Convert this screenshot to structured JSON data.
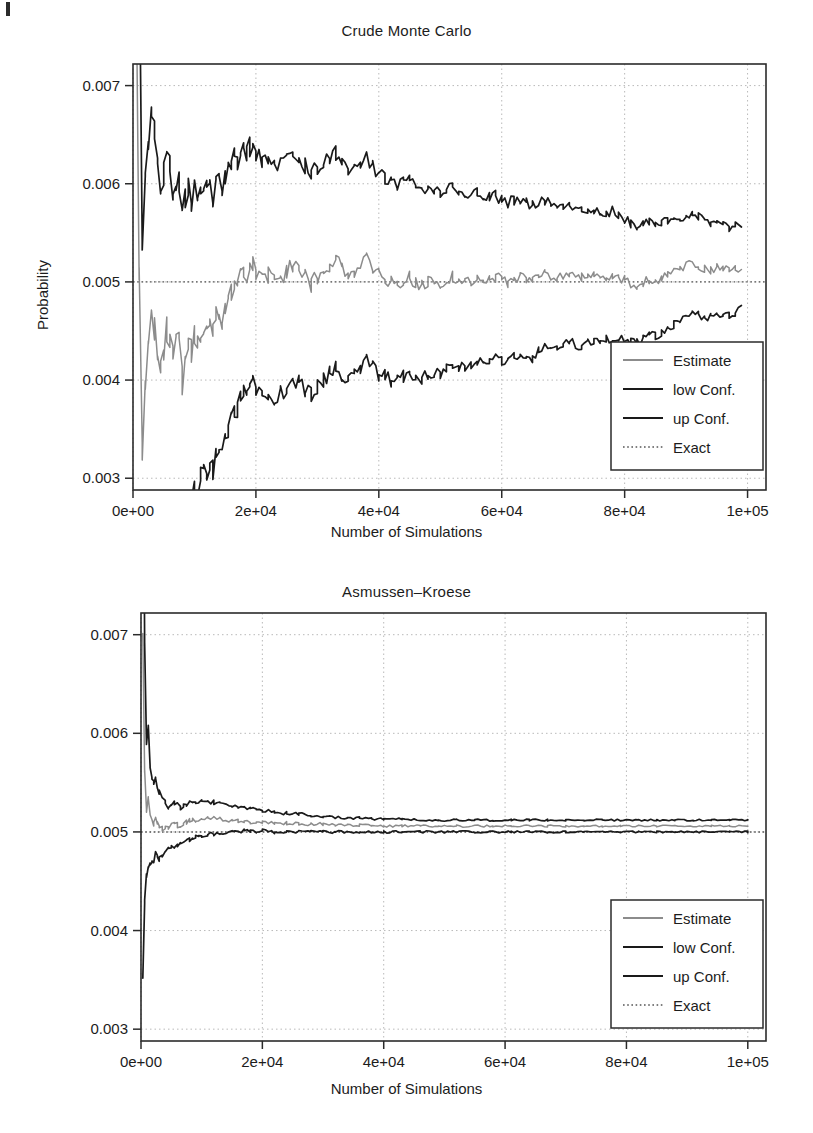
{
  "figure": {
    "scan_artifact": "page-edge-mark",
    "axis_label_x": "Number of Simulations",
    "axis_label_y": "Probability"
  },
  "colors": {
    "estimate": "#8c8c8c",
    "low_conf": "#1a1a1a",
    "up_conf": "#1a1a1a",
    "exact": "#555555",
    "frame": "#2b2b2b",
    "grid": "#b9b9b9",
    "background": "#ffffff"
  },
  "legend": {
    "entries": [
      {
        "label": "Estimate",
        "style": "solid",
        "color_key": "estimate"
      },
      {
        "label": "low Conf.",
        "style": "solid",
        "color_key": "low_conf"
      },
      {
        "label": "up Conf.",
        "style": "solid",
        "color_key": "up_conf"
      },
      {
        "label": "Exact",
        "style": "dotted",
        "color_key": "exact"
      }
    ],
    "position": "bottom-right"
  },
  "chart_data": [
    {
      "id": "crude-monte-carlo",
      "type": "line",
      "title": "Crude Monte Carlo",
      "xlabel": "Number of Simulations",
      "ylabel": "Probability",
      "xlim": [
        0,
        103000
      ],
      "ylim": [
        0.00288,
        0.00722
      ],
      "xticks": [
        0,
        20000,
        40000,
        60000,
        80000,
        100000
      ],
      "xticklabels": [
        "0e+00",
        "2e+04",
        "4e+04",
        "6e+04",
        "8e+04",
        "1e+05"
      ],
      "yticks": [
        0.003,
        0.004,
        0.005,
        0.006,
        0.007
      ],
      "yticklabels": [
        "0.003",
        "0.004",
        "0.005",
        "0.006",
        "0.007"
      ],
      "grid": true,
      "legend": "bottom-right",
      "exact_value": 0.005,
      "x": [
        500,
        1000,
        1500,
        2000,
        2500,
        3000,
        3500,
        4000,
        4500,
        5000,
        5500,
        6000,
        6500,
        7000,
        7500,
        8000,
        8500,
        9000,
        9500,
        10000,
        10500,
        11000,
        11500,
        12000,
        12500,
        13000,
        13500,
        14000,
        14500,
        15000,
        15500,
        16000,
        16500,
        17000,
        17500,
        18000,
        18500,
        19000,
        19500,
        20000,
        21000,
        22000,
        23000,
        24000,
        25000,
        26000,
        27000,
        28000,
        29000,
        30000,
        31000,
        32000,
        33000,
        34000,
        35000,
        36000,
        37000,
        38000,
        39000,
        40000,
        41000,
        42000,
        43000,
        44000,
        45000,
        46000,
        47000,
        48000,
        49000,
        50000,
        51000,
        52000,
        53000,
        54000,
        55000,
        56000,
        57000,
        58000,
        59000,
        60000,
        61000,
        62000,
        63000,
        64000,
        65000,
        66000,
        67000,
        68000,
        69000,
        70000,
        71000,
        72000,
        73000,
        74000,
        75000,
        76000,
        77000,
        78000,
        79000,
        80000,
        81000,
        82000,
        83000,
        84000,
        85000,
        86000,
        87000,
        88000,
        89000,
        90000,
        91000,
        92000,
        93000,
        94000,
        95000,
        96000,
        97000,
        98000,
        99000,
        100000
      ],
      "series": [
        {
          "name": "Estimate",
          "color_key": "estimate",
          "values": [
            0.0082,
            0.005,
            0.0033,
            0.00395,
            0.0044,
            0.00468,
            0.00452,
            0.0043,
            0.00418,
            0.0043,
            0.0045,
            0.00443,
            0.00428,
            0.00432,
            0.0044,
            0.004,
            0.00428,
            0.00438,
            0.0043,
            0.00442,
            0.00436,
            0.00444,
            0.00452,
            0.00448,
            0.00455,
            0.00448,
            0.00465,
            0.0047,
            0.00462,
            0.00476,
            0.00485,
            0.00492,
            0.005,
            0.00496,
            0.00508,
            0.00515,
            0.00505,
            0.00512,
            0.0052,
            0.0051,
            0.00502,
            0.00508,
            0.00498,
            0.00505,
            0.0051,
            0.00516,
            0.00512,
            0.00505,
            0.00498,
            0.00505,
            0.00512,
            0.00516,
            0.00522,
            0.00514,
            0.00508,
            0.00512,
            0.00518,
            0.00524,
            0.00516,
            0.00508,
            0.00505,
            0.005,
            0.00498,
            0.00502,
            0.00505,
            0.005,
            0.00497,
            0.005,
            0.00502,
            0.00499,
            0.00502,
            0.00506,
            0.00503,
            0.005,
            0.00502,
            0.00504,
            0.00501,
            0.00503,
            0.00505,
            0.00502,
            0.005,
            0.00503,
            0.00506,
            0.00503,
            0.005,
            0.00504,
            0.00507,
            0.00505,
            0.00503,
            0.00506,
            0.00509,
            0.00506,
            0.00504,
            0.00507,
            0.00505,
            0.00503,
            0.00506,
            0.00508,
            0.00505,
            0.00502,
            0.00499,
            0.00497,
            0.005,
            0.00503,
            0.00501,
            0.00504,
            0.00507,
            0.0051,
            0.00513,
            0.00516,
            0.00519,
            0.00517,
            0.00514,
            0.00512,
            0.00514,
            0.00513,
            0.00511,
            0.00513,
            0.00515
          ]
        },
        {
          "name": "low Conf.",
          "color_key": "low_conf",
          "values": [
            0.002,
            0.0015,
            0.0012,
            0.0018,
            0.0023,
            0.00265,
            0.00255,
            0.00242,
            0.00236,
            0.00252,
            0.00272,
            0.00268,
            0.00258,
            0.00265,
            0.00275,
            0.0024,
            0.00272,
            0.00283,
            0.00278,
            0.00292,
            0.00288,
            0.00298,
            0.00308,
            0.00305,
            0.00314,
            0.00308,
            0.00326,
            0.00333,
            0.00326,
            0.00342,
            0.00352,
            0.0036,
            0.0037,
            0.00367,
            0.0038,
            0.00388,
            0.00379,
            0.00387,
            0.00396,
            0.00387,
            0.00381,
            0.00388,
            0.00379,
            0.00387,
            0.00393,
            0.004,
            0.00397,
            0.00391,
            0.00385,
            0.00393,
            0.00401,
            0.00406,
            0.00413,
            0.00406,
            0.00401,
            0.00406,
            0.00413,
            0.0042,
            0.00413,
            0.00406,
            0.00404,
            0.004,
            0.00399,
            0.00404,
            0.00408,
            0.00404,
            0.00402,
            0.00406,
            0.00409,
            0.00407,
            0.00411,
            0.00416,
            0.00414,
            0.00412,
            0.00415,
            0.00418,
            0.00416,
            0.00419,
            0.00422,
            0.0042,
            0.00419,
            0.00423,
            0.00427,
            0.00425,
            0.00423,
            0.00428,
            0.00432,
            0.00431,
            0.0043,
            0.00434,
            0.00438,
            0.00436,
            0.00435,
            0.00439,
            0.00438,
            0.00437,
            0.00441,
            0.00444,
            0.00442,
            0.0044,
            0.00438,
            0.00437,
            0.00441,
            0.00445,
            0.00444,
            0.00448,
            0.00452,
            0.00456,
            0.0046,
            0.00464,
            0.00468,
            0.00467,
            0.00465,
            0.00464,
            0.00467,
            0.00467,
            0.00466,
            0.00469,
            0.00472
          ]
        },
        {
          "name": "up Conf.",
          "color_key": "up_conf",
          "values": [
            0.0144,
            0.0085,
            0.0054,
            0.0061,
            0.0065,
            0.00671,
            0.00649,
            0.00618,
            0.006,
            0.00608,
            0.00628,
            0.00618,
            0.00598,
            0.00599,
            0.00605,
            0.0056,
            0.00584,
            0.00593,
            0.00582,
            0.00592,
            0.00584,
            0.0059,
            0.00596,
            0.00591,
            0.00596,
            0.00588,
            0.00604,
            0.00607,
            0.00598,
            0.0061,
            0.00618,
            0.00624,
            0.0063,
            0.00625,
            0.00636,
            0.00642,
            0.00631,
            0.00637,
            0.00644,
            0.00633,
            0.00623,
            0.00628,
            0.00617,
            0.00623,
            0.00627,
            0.00632,
            0.00627,
            0.00619,
            0.00611,
            0.00617,
            0.00623,
            0.00626,
            0.00631,
            0.00622,
            0.00615,
            0.00618,
            0.00623,
            0.00628,
            0.00619,
            0.0061,
            0.00606,
            0.006,
            0.00597,
            0.006,
            0.00602,
            0.00596,
            0.00592,
            0.00594,
            0.00595,
            0.00591,
            0.00593,
            0.00596,
            0.00592,
            0.00588,
            0.00589,
            0.0059,
            0.00586,
            0.00587,
            0.00588,
            0.00584,
            0.00581,
            0.00583,
            0.00585,
            0.00581,
            0.00577,
            0.0058,
            0.00582,
            0.00579,
            0.00576,
            0.00578,
            0.0058,
            0.00576,
            0.00573,
            0.00575,
            0.00572,
            0.00569,
            0.00571,
            0.00572,
            0.00568,
            0.00564,
            0.0056,
            0.00557,
            0.00559,
            0.00561,
            0.00558,
            0.0056,
            0.00562,
            0.00564,
            0.00566,
            0.00568,
            0.0057,
            0.00567,
            0.00563,
            0.0056,
            0.00561,
            0.00559,
            0.00556,
            0.00557,
            0.00558
          ]
        }
      ]
    },
    {
      "id": "asmussen-kroese",
      "type": "line",
      "title": "Asmussen–Kroese",
      "xlabel": "Number of Simulations",
      "ylabel": "Probability",
      "xlim": [
        0,
        103000
      ],
      "ylim": [
        0.00288,
        0.00722
      ],
      "xticks": [
        0,
        20000,
        40000,
        60000,
        80000,
        100000
      ],
      "xticklabels": [
        "0e+00",
        "2e+04",
        "4e+04",
        "6e+04",
        "8e+04",
        "1e+05"
      ],
      "yticks": [
        0.003,
        0.004,
        0.005,
        0.006,
        0.007
      ],
      "yticklabels": [
        "0.003",
        "0.004",
        "0.005",
        "0.006",
        "0.007"
      ],
      "grid": true,
      "legend": "bottom-right",
      "exact_value": 0.005,
      "x": [
        300,
        600,
        900,
        1200,
        1500,
        1800,
        2100,
        2400,
        2700,
        3000,
        3500,
        4000,
        4500,
        5000,
        5500,
        6000,
        6500,
        7000,
        7500,
        8000,
        8500,
        9000,
        9500,
        10000,
        11000,
        12000,
        13000,
        14000,
        15000,
        16000,
        17000,
        18000,
        19000,
        20000,
        22000,
        24000,
        26000,
        28000,
        30000,
        32000,
        34000,
        36000,
        38000,
        40000,
        43000,
        46000,
        49000,
        52000,
        55000,
        58000,
        61000,
        64000,
        67000,
        70000,
        73000,
        76000,
        79000,
        82000,
        85000,
        88000,
        91000,
        94000,
        97000,
        100000
      ],
      "series": [
        {
          "name": "Estimate",
          "color_key": "estimate",
          "values": [
            0.007,
            0.0056,
            0.00522,
            0.00535,
            0.00518,
            0.00512,
            0.00508,
            0.00516,
            0.0051,
            0.00506,
            0.00503,
            0.00505,
            0.00504,
            0.00506,
            0.00508,
            0.00507,
            0.00506,
            0.00508,
            0.0051,
            0.00511,
            0.00512,
            0.00511,
            0.00512,
            0.00512,
            0.00513,
            0.00514,
            0.00513,
            0.00512,
            0.00512,
            0.00511,
            0.00511,
            0.0051,
            0.0051,
            0.0051,
            0.00509,
            0.00509,
            0.00508,
            0.00508,
            0.00508,
            0.00507,
            0.00507,
            0.00507,
            0.00506,
            0.00506,
            0.00506,
            0.00506,
            0.00506,
            0.00506,
            0.00506,
            0.00506,
            0.00506,
            0.00506,
            0.00506,
            0.00506,
            0.00506,
            0.00506,
            0.00506,
            0.00506,
            0.00506,
            0.00506,
            0.00506,
            0.00506,
            0.00506,
            0.00506
          ]
        },
        {
          "name": "low Conf.",
          "color_key": "low_conf",
          "values": [
            0.0035,
            0.0043,
            0.00455,
            0.00462,
            0.00468,
            0.0047,
            0.00467,
            0.00478,
            0.00474,
            0.00472,
            0.00476,
            0.0048,
            0.00482,
            0.00484,
            0.00486,
            0.00487,
            0.00488,
            0.0049,
            0.00492,
            0.00493,
            0.00494,
            0.00494,
            0.00495,
            0.00496,
            0.00497,
            0.00498,
            0.00499,
            0.00499,
            0.005,
            0.00501,
            0.00501,
            0.00501,
            0.00501,
            0.00501,
            0.005,
            0.005,
            0.005,
            0.005,
            0.005,
            0.005,
            0.005,
            0.005,
            0.005,
            0.005,
            0.005,
            0.005,
            0.005,
            0.005,
            0.005,
            0.005,
            0.005,
            0.005,
            0.005,
            0.005,
            0.005,
            0.005,
            0.005,
            0.005,
            0.005,
            0.005,
            0.005,
            0.005,
            0.005,
            0.005
          ]
        },
        {
          "name": "up Conf.",
          "color_key": "up_conf",
          "values": [
            0.0105,
            0.0069,
            0.0059,
            0.00608,
            0.00568,
            0.00554,
            0.00549,
            0.00554,
            0.00546,
            0.0054,
            0.00534,
            0.0053,
            0.00526,
            0.00528,
            0.0053,
            0.00527,
            0.00524,
            0.00526,
            0.00528,
            0.00529,
            0.0053,
            0.00529,
            0.0053,
            0.0053,
            0.0053,
            0.0053,
            0.00529,
            0.00528,
            0.00527,
            0.00526,
            0.00525,
            0.00524,
            0.00523,
            0.00522,
            0.0052,
            0.00519,
            0.00518,
            0.00517,
            0.00516,
            0.00515,
            0.00514,
            0.00514,
            0.00513,
            0.00513,
            0.00513,
            0.00512,
            0.00512,
            0.00512,
            0.00512,
            0.00512,
            0.00512,
            0.00512,
            0.00512,
            0.00512,
            0.00512,
            0.00512,
            0.00512,
            0.00512,
            0.00512,
            0.00512,
            0.00512,
            0.00512,
            0.00512,
            0.00512
          ]
        }
      ]
    }
  ]
}
